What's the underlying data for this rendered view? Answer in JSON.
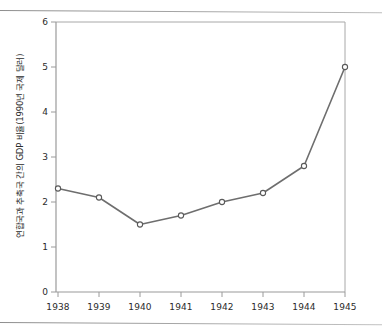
{
  "chart_data": {
    "type": "line",
    "title": "",
    "xlabel": "",
    "ylabel": "연합국과 추축국 간의 GDP 비율(1990년 국제 달러)",
    "categories": [
      "1938",
      "1939",
      "1940",
      "1941",
      "1942",
      "1943",
      "1944",
      "1945"
    ],
    "values": [
      2.3,
      2.1,
      1.5,
      1.7,
      2.0,
      2.2,
      2.8,
      5.0
    ],
    "series": [
      {
        "name": "연합국/추축국 GDP 비율",
        "values": [
          2.3,
          2.1,
          1.5,
          1.7,
          2.0,
          2.2,
          2.8,
          5.0
        ]
      }
    ],
    "ylim": [
      0,
      6
    ],
    "ytick_labels": [
      "0",
      "1",
      "2",
      "3",
      "4",
      "5",
      "6"
    ],
    "ytick_values": [
      0,
      1,
      2,
      3,
      4,
      5,
      6
    ],
    "xtick_labels": [
      "1938",
      "1939",
      "1940",
      "1941",
      "1942",
      "1943",
      "1944",
      "1945"
    ],
    "grid": false,
    "legend": false,
    "legend_position": "none",
    "marker": "open-circle",
    "line_color": "#6e6e6e",
    "marker_face_color": "#ffffff",
    "marker_edge_color": "#5a5a5a",
    "axis_color": "#9a9a9a",
    "text_color": "#2b2b2b",
    "background_color": "#ffffff"
  }
}
